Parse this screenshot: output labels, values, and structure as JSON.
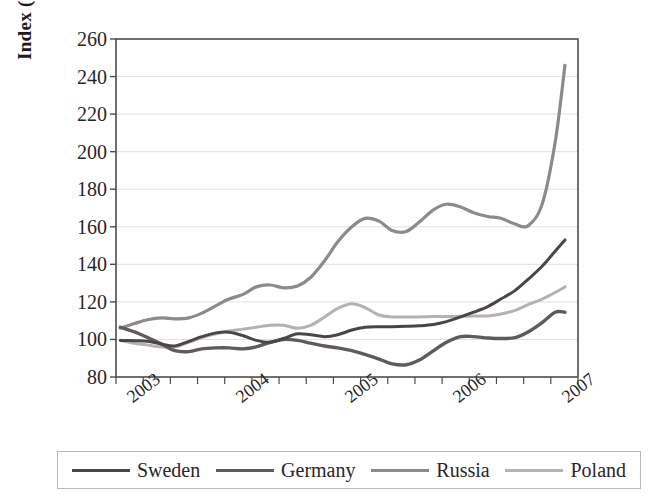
{
  "chart_data": {
    "type": "line",
    "title": "",
    "xlabel": "",
    "ylabel": "Index (2002=100)",
    "ylim": [
      80,
      260
    ],
    "ytick_step": 20,
    "yticks": [
      80,
      100,
      120,
      140,
      160,
      180,
      200,
      220,
      240,
      260
    ],
    "xticks": [
      "2003",
      "2004",
      "2005",
      "2006",
      "2007"
    ],
    "xlim": [
      2002.75,
      2007.0
    ],
    "grid": "horizontal",
    "legend_position": "bottom",
    "x": [
      2002.79,
      2002.92,
      2003.04,
      2003.17,
      2003.29,
      2003.42,
      2003.54,
      2003.67,
      2003.79,
      2003.92,
      2004.04,
      2004.17,
      2004.29,
      2004.42,
      2004.54,
      2004.67,
      2004.79,
      2004.92,
      2005.04,
      2005.17,
      2005.29,
      2005.42,
      2005.54,
      2005.67,
      2005.79,
      2005.92,
      2006.04,
      2006.17,
      2006.29,
      2006.42,
      2006.54,
      2006.67,
      2006.79,
      2006.88
    ],
    "series": [
      {
        "name": "Sweden",
        "color": "#4a4647",
        "width": 3.0,
        "values": [
          99.5,
          99.3,
          99.0,
          97.5,
          96.5,
          99.0,
          101.5,
          103.5,
          103.8,
          102.0,
          99.5,
          98.5,
          100.5,
          103.0,
          102.5,
          101.5,
          102.5,
          105.0,
          106.5,
          106.8,
          106.8,
          107.0,
          107.3,
          108.0,
          109.5,
          112.0,
          114.5,
          117.5,
          121.5,
          126.0,
          132.0,
          139.0,
          147.0,
          153.0
        ]
      },
      {
        "name": "Germany",
        "color": "#5f5a5b",
        "width": 3.4,
        "values": [
          106.5,
          104.0,
          101.0,
          97.5,
          94.0,
          93.5,
          95.0,
          95.5,
          95.5,
          95.0,
          96.0,
          98.5,
          100.0,
          99.5,
          98.0,
          96.5,
          95.5,
          94.0,
          92.0,
          89.5,
          87.0,
          86.5,
          89.0,
          94.0,
          98.5,
          101.5,
          101.5,
          100.8,
          100.5,
          101.0,
          104.0,
          109.0,
          114.5,
          114.5
        ]
      },
      {
        "name": "Russia",
        "color": "#8e8a88",
        "width": 3.2,
        "values": [
          106.0,
          108.5,
          110.5,
          111.5,
          111.0,
          111.5,
          114.0,
          118.0,
          121.5,
          124.0,
          128.0,
          129.0,
          127.5,
          128.5,
          133.0,
          142.0,
          152.0,
          160.0,
          164.5,
          163.0,
          158.0,
          157.5,
          162.5,
          169.0,
          172.0,
          170.5,
          167.5,
          165.5,
          164.5,
          161.5,
          160.5,
          172.0,
          205.0,
          246.0
        ]
      },
      {
        "name": "Poland",
        "color": "#b5b2b0",
        "width": 3.0,
        "values": [
          99.5,
          98.0,
          97.0,
          96.0,
          96.0,
          98.5,
          101.0,
          103.0,
          104.5,
          105.5,
          106.5,
          107.5,
          107.5,
          106.0,
          107.5,
          112.0,
          116.5,
          119.0,
          117.0,
          113.0,
          112.0,
          112.0,
          112.0,
          112.2,
          112.2,
          112.3,
          112.5,
          112.5,
          113.5,
          115.5,
          118.5,
          121.5,
          125.0,
          128.0
        ]
      }
    ]
  },
  "axis": {
    "y_title": "Index (2002=100)"
  },
  "legend": {
    "items": [
      {
        "label": "Sweden",
        "color": "#4a4647",
        "width": 3.0
      },
      {
        "label": "Germany",
        "color": "#5f5a5b",
        "width": 3.4
      },
      {
        "label": "Russia",
        "color": "#8e8a88",
        "width": 3.2
      },
      {
        "label": "Poland",
        "color": "#b5b2b0",
        "width": 3.0
      }
    ]
  },
  "plot_geometry": {
    "left": 116,
    "right": 578,
    "top": 39,
    "bottom": 377
  },
  "colors": {
    "axis": "#4f4b4a",
    "grid": "#e2e0de",
    "text": "#2a2627",
    "legend_border": "#b9b6b4"
  }
}
